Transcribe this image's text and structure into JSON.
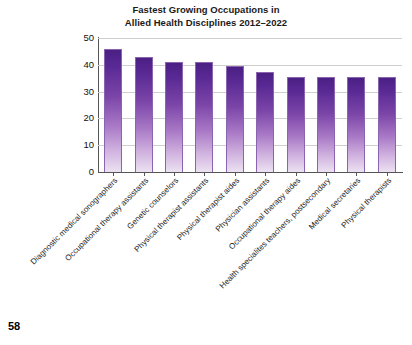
{
  "page": {
    "number": "58"
  },
  "chart_data": {
    "type": "bar",
    "title": "Fastest Growing Occupations in Allied Health Disciplines 2012–2022",
    "title_lines": [
      "Fastest Growing Occupations in",
      "Allied Health Disciplines 2012–2022"
    ],
    "xlabel": "",
    "ylabel": "",
    "ylim": [
      0,
      50
    ],
    "yticks": [
      0,
      10,
      20,
      30,
      40,
      50
    ],
    "ytick_labels": [
      "0",
      "10",
      "20",
      "30",
      "40",
      "50"
    ],
    "grid": true,
    "grid_axis": "y",
    "legend": false,
    "bar_color_top": "#4a2084",
    "bar_color_bottom": "#ece2f2",
    "bar_edge_color": "#8b63ae",
    "categories": [
      "Diagnostic medical sonographers",
      "Occupational therapy assistants",
      "Genetic counselors",
      "Physical therapist assistants",
      "Physical therapist aides",
      "Physician assistants",
      "Occupational therapy aides",
      "Health specialites teachers, postsecondary",
      "Medical secretaries",
      "Physical therapists"
    ],
    "values": [
      46,
      42.8,
      41,
      41,
      39.7,
      37.5,
      35.5,
      35.5,
      35.5,
      35.5
    ]
  }
}
